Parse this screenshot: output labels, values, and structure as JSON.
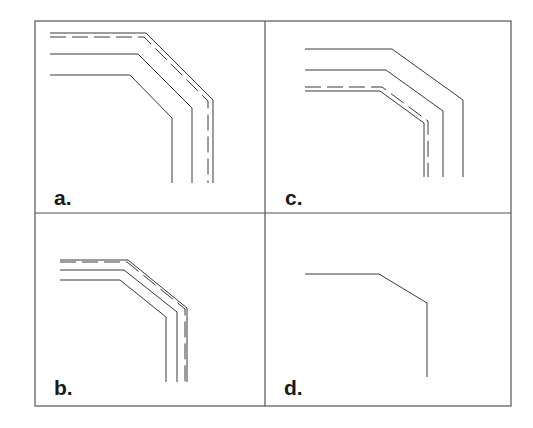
{
  "figure": {
    "border_color": "#555555",
    "line_color": "#3a3a3a",
    "frame": {
      "x": 35,
      "y": 21,
      "width": 476,
      "height": 385,
      "divider_x": 265,
      "divider_y": 213
    },
    "panels": [
      {
        "id": "a",
        "label": "a.",
        "label_pos": [
          54,
          205
        ],
        "paths": [
          {
            "style": "solid",
            "points": [
              [
                50,
                33
              ],
              [
                146,
                33
              ],
              [
                213,
                100
              ],
              [
                213,
                183
              ]
            ]
          },
          {
            "style": "dashed",
            "points": [
              [
                50,
                37
              ],
              [
                144,
                37
              ],
              [
                208,
                101
              ],
              [
                208,
                183
              ]
            ]
          },
          {
            "style": "solid",
            "points": [
              [
                50,
                54
              ],
              [
                138,
                54
              ],
              [
                192,
                108
              ],
              [
                192,
                183
              ]
            ]
          },
          {
            "style": "solid",
            "points": [
              [
                50,
                75
              ],
              [
                130,
                75
              ],
              [
                172,
                118
              ],
              [
                172,
                183
              ]
            ]
          }
        ]
      },
      {
        "id": "c",
        "label": "c.",
        "label_pos": [
          285,
          205
        ],
        "paths": [
          {
            "style": "solid",
            "points": [
              [
                305,
                49
              ],
              [
                392,
                49
              ],
              [
                463,
                100
              ],
              [
                463,
                177
              ]
            ]
          },
          {
            "style": "solid",
            "points": [
              [
                305,
                70
              ],
              [
                386,
                70
              ],
              [
                443,
                111
              ],
              [
                443,
                177
              ]
            ]
          },
          {
            "style": "dashed",
            "points": [
              [
                305,
                87
              ],
              [
                382,
                87
              ],
              [
                428,
                121
              ],
              [
                428,
                177
              ]
            ]
          },
          {
            "style": "solid",
            "points": [
              [
                305,
                91
              ],
              [
                380,
                91
              ],
              [
                424,
                123
              ],
              [
                424,
                177
              ]
            ]
          }
        ]
      },
      {
        "id": "b",
        "label": "b.",
        "label_pos": [
          54,
          395
        ],
        "paths": [
          {
            "style": "solid",
            "points": [
              [
                60,
                260
              ],
              [
                128,
                260
              ],
              [
                187,
                308
              ],
              [
                187,
                382
              ]
            ]
          },
          {
            "style": "dashed",
            "points": [
              [
                60,
                262
              ],
              [
                127,
                262
              ],
              [
                185,
                309
              ],
              [
                185,
                382
              ]
            ]
          },
          {
            "style": "solid",
            "points": [
              [
                60,
                270
              ],
              [
                124,
                270
              ],
              [
                177,
                312
              ],
              [
                177,
                382
              ]
            ]
          },
          {
            "style": "solid",
            "points": [
              [
                60,
                280
              ],
              [
                120,
                280
              ],
              [
                166,
                317
              ],
              [
                166,
                382
              ]
            ]
          }
        ]
      },
      {
        "id": "d",
        "label": "d.",
        "label_pos": [
          284,
          395
        ],
        "paths": [
          {
            "style": "solid",
            "points": [
              [
                305,
                274
              ],
              [
                379,
                274
              ],
              [
                427,
                303
              ],
              [
                427,
                377
              ]
            ]
          }
        ]
      }
    ]
  }
}
